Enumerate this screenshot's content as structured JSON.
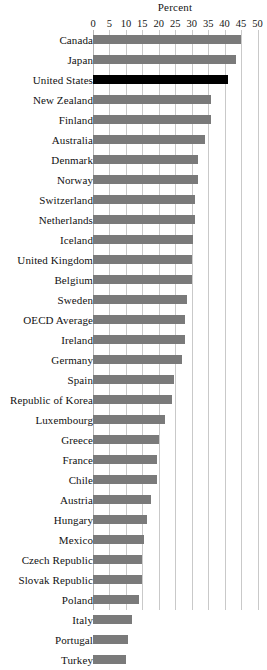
{
  "chart_data": {
    "type": "bar",
    "orientation": "horizontal",
    "title": "Percent",
    "xlabel": "",
    "ylabel": "",
    "xlim": [
      0,
      50
    ],
    "ticks": [
      0,
      5,
      10,
      15,
      20,
      25,
      30,
      35,
      40,
      45,
      50
    ],
    "grid": true,
    "legend": "none",
    "bar_color": "#7a7a7a",
    "highlight_color": "#000000",
    "highlight_category": "United States",
    "categories": [
      "Canada",
      "Japan",
      "United States",
      "New Zealand",
      "Finland",
      "Australia",
      "Denmark",
      "Norway",
      "Switzerland",
      "Netherlands",
      "Iceland",
      "United Kingdom",
      "Belgium",
      "Sweden",
      "OECD Average",
      "Ireland",
      "Germany",
      "Spain",
      "Republic of Korea",
      "Luxembourg",
      "Greece",
      "France",
      "Chile",
      "Austria",
      "Hungary",
      "Mexico",
      "Czech Republic",
      "Slovak Republic",
      "Poland",
      "Italy",
      "Portugal",
      "Turkey"
    ],
    "values": [
      45.0,
      43.5,
      41.0,
      36.0,
      36.0,
      34.0,
      32.0,
      32.0,
      31.0,
      31.0,
      30.5,
      30.0,
      30.0,
      28.5,
      28.0,
      28.0,
      27.0,
      24.5,
      24.0,
      22.0,
      20.0,
      19.5,
      19.5,
      17.5,
      16.5,
      15.5,
      15.0,
      15.0,
      14.0,
      12.0,
      10.5,
      10.0
    ]
  }
}
